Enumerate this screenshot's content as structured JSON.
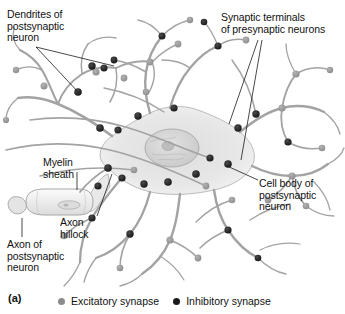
{
  "figure": {
    "panel_letter": "(a)"
  },
  "labels": [
    {
      "id": "dendrites",
      "name": "label-dendrites-of-postsynaptic-neuron",
      "text": "Dendrites of\npostsynaptic\nneuron",
      "x": 7,
      "y": 9,
      "width": 92
    },
    {
      "id": "synaptic_terminals",
      "name": "label-synaptic-terminals-of-presynaptic-neurons",
      "text": "Synaptic terminals\nof presynaptic neurons",
      "x": 221,
      "y": 12,
      "width": 124
    },
    {
      "id": "myelin_sheath",
      "name": "label-myelin-sheath",
      "text": "Myelin\nsheath",
      "x": 43,
      "y": 157,
      "width": 60
    },
    {
      "id": "cell_body",
      "name": "label-cell-body-of-postsynaptic-neuron",
      "text": "Cell body of\npostsynaptic\nneuron",
      "x": 259,
      "y": 178,
      "width": 84
    },
    {
      "id": "axon_hillock",
      "name": "label-axon-hillock",
      "text": "Axon\nhillock",
      "x": 60,
      "y": 217,
      "width": 48
    },
    {
      "id": "axon_of_postsynaptic_neuron",
      "name": "label-axon-of-postsynaptic-neuron",
      "text": "Axon of\npostsynaptic\nneuron",
      "x": 7,
      "y": 239,
      "width": 78
    }
  ],
  "legend": {
    "items": [
      {
        "id": "excitatory",
        "label": "Excitatory synapse",
        "color": "#8c8c8c"
      },
      {
        "id": "inhibitory",
        "label": "Inhibitory synapse",
        "color": "#1b1b1b"
      }
    ]
  },
  "colors": {
    "background": "#ffffff",
    "neuron_outline": "#9a9a9a",
    "neuron_fill": "#e8e8e8",
    "soma_fill": "#e3e3e3",
    "nucleus_fill": "#d6d6d6",
    "excitatory_terminal": "#8c8c8c",
    "inhibitory_terminal": "#1b1b1b",
    "leader_line": "#1a1a1a",
    "text": "#111111"
  },
  "synapse_counts": {
    "excitatory_visible": 24,
    "inhibitory_visible": 26
  }
}
